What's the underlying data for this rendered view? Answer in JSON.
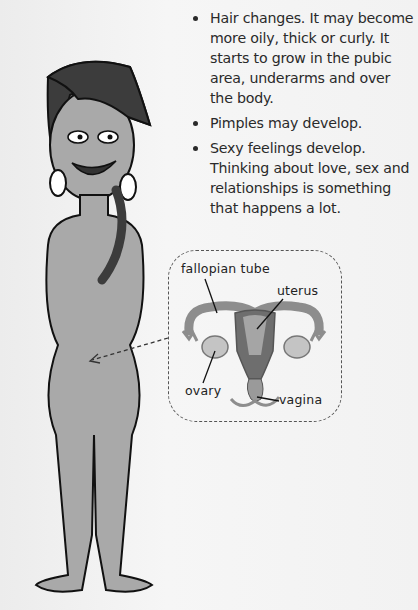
{
  "bullets": [
    {
      "text": "Hair changes. It may become more oily, thick or curly. It starts to grow in the pubic area, underarms and over the body."
    },
    {
      "text": "Pimples may develop."
    },
    {
      "text": "Sexy feelings develop. Thinking about love, sex and relationships is something that happens a lot."
    }
  ],
  "diagram": {
    "labels": {
      "fallopian_tube": "fallopian tube",
      "uterus": "uterus",
      "ovary": "ovary",
      "vagina": "vagina"
    }
  },
  "colors": {
    "figure_fill": "#a9a9a9",
    "organ_fill": "#9a9a9a",
    "organ_dark": "#6e6e6e",
    "outline": "#111111",
    "text": "#2a2a2a"
  }
}
